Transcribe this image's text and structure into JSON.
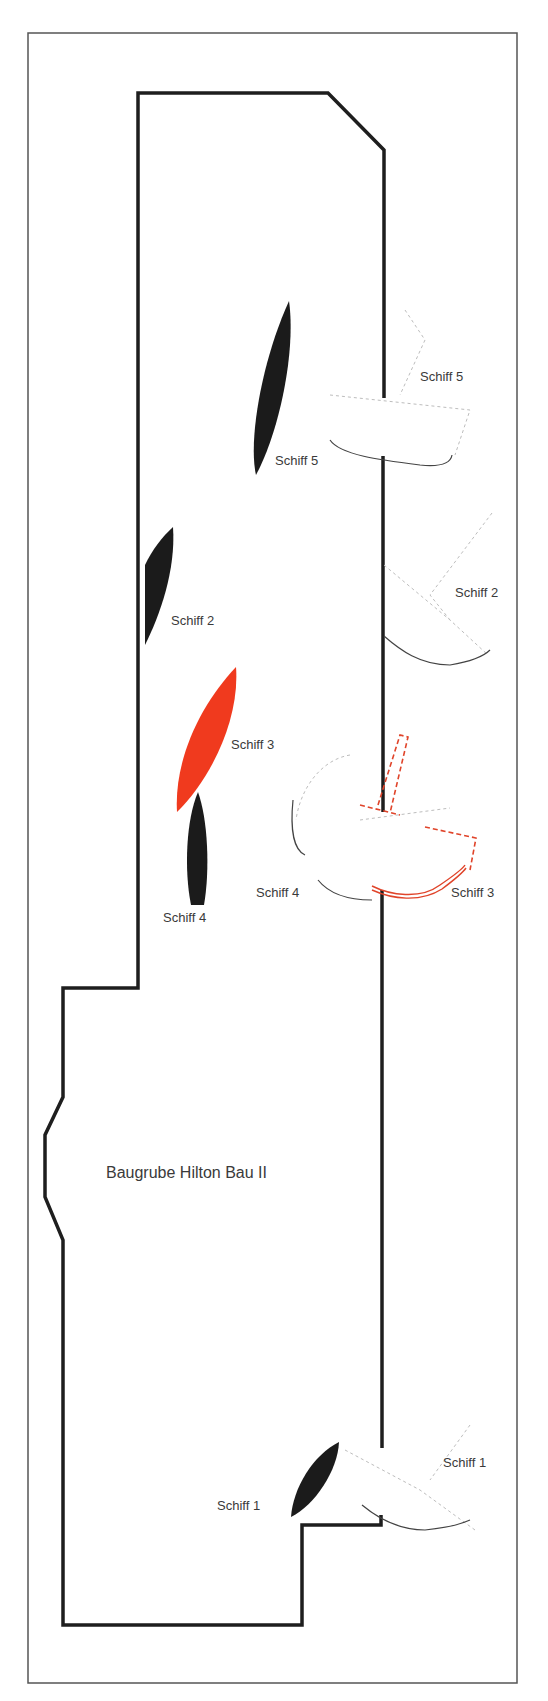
{
  "diagram": {
    "site_label": "Baugrube Hilton Bau II",
    "colors": {
      "wall": "#1e1e1e",
      "ship_black": "#1b1b1b",
      "ship_red": "#f03a1e",
      "frame": "#555555",
      "label": "#3a3a3a"
    },
    "ships_inside": [
      {
        "id": "schiff-5",
        "label": "Schiff 5",
        "color": "black"
      },
      {
        "id": "schiff-2",
        "label": "Schiff 2",
        "color": "black"
      },
      {
        "id": "schiff-3",
        "label": "Schiff 3",
        "color": "red"
      },
      {
        "id": "schiff-4",
        "label": "Schiff 4",
        "color": "black"
      },
      {
        "id": "schiff-1",
        "label": "Schiff 1",
        "color": "black"
      }
    ],
    "ships_outside": [
      {
        "id": "schiff-5-outline",
        "label": "Schiff 5"
      },
      {
        "id": "schiff-2-outline",
        "label": "Schiff 2"
      },
      {
        "id": "schiff-4-outline",
        "label": "Schiff 4"
      },
      {
        "id": "schiff-3-outline",
        "label": "Schiff 3"
      },
      {
        "id": "schiff-1-outline",
        "label": "Schiff 1"
      }
    ]
  }
}
